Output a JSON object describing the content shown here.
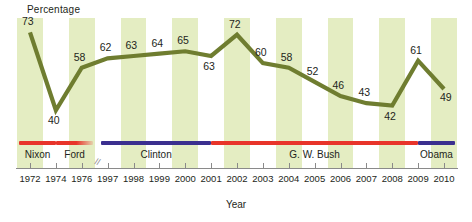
{
  "chart_data": {
    "type": "line",
    "title": "",
    "ylabel": "Percentage",
    "xlabel": "Year",
    "categories": [
      "1972",
      "1974",
      "1976",
      "1997",
      "1998",
      "1999",
      "2000",
      "2001",
      "2002",
      "2003",
      "2004",
      "2005",
      "2006",
      "2007",
      "2008",
      "2009",
      "2010"
    ],
    "values": [
      73,
      40,
      58,
      62,
      63,
      64,
      65,
      63,
      72,
      60,
      58,
      52,
      46,
      43,
      42,
      61,
      49
    ],
    "axis_break_after": "1976",
    "ylim": [
      30,
      80
    ],
    "grid": false,
    "legend": "none",
    "series_color": "#6f7d30",
    "band_color": "#e4edc2",
    "annotations": [
      {
        "label": "Nixon",
        "color": "#e8342a",
        "start": "1972",
        "end": "1974"
      },
      {
        "label": "Ford",
        "color": "#e8342a",
        "start": "1974",
        "end": "1976"
      },
      {
        "label": "Clinton",
        "color": "#3b2f8f",
        "start": "1997",
        "end": "2001"
      },
      {
        "label": "G. W. Bush",
        "color": "#e8342a",
        "start": "2001",
        "end": "2009"
      },
      {
        "label": "Obama",
        "color": "#3b2f8f",
        "start": "2009",
        "end": "2010"
      }
    ]
  },
  "labels": {
    "y_axis_title": "Percentage",
    "x_axis_title": "Year"
  },
  "presidents": [
    {
      "name": "Nixon"
    },
    {
      "name": "Ford"
    },
    {
      "name": "Clinton"
    },
    {
      "name": "G. W. Bush"
    },
    {
      "name": "Obama"
    }
  ],
  "ticks": [
    "1972",
    "1974",
    "1976",
    "1997",
    "1998",
    "1999",
    "2000",
    "2001",
    "2002",
    "2003",
    "2004",
    "2005",
    "2006",
    "2007",
    "2008",
    "2009",
    "2010"
  ],
  "points": [
    {
      "year": "1972",
      "value": "73"
    },
    {
      "year": "1974",
      "value": "40"
    },
    {
      "year": "1976",
      "value": "58"
    },
    {
      "year": "1997",
      "value": "62"
    },
    {
      "year": "1998",
      "value": "63"
    },
    {
      "year": "1999",
      "value": "64"
    },
    {
      "year": "2000",
      "value": "65"
    },
    {
      "year": "2001",
      "value": "63"
    },
    {
      "year": "2002",
      "value": "72"
    },
    {
      "year": "2003",
      "value": "60"
    },
    {
      "year": "2004",
      "value": "58"
    },
    {
      "year": "2005",
      "value": "52"
    },
    {
      "year": "2006",
      "value": "46"
    },
    {
      "year": "2007",
      "value": "43"
    },
    {
      "year": "2008",
      "value": "42"
    },
    {
      "year": "2009",
      "value": "61"
    },
    {
      "year": "2010",
      "value": "49"
    }
  ],
  "break_symbol": "//"
}
